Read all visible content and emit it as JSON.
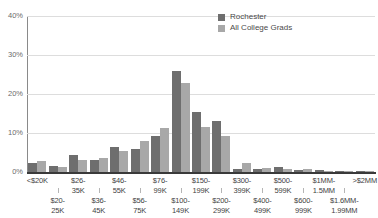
{
  "chart_data": {
    "type": "bar",
    "title": "",
    "xlabel": "",
    "ylabel": "",
    "ylim": [
      0,
      40
    ],
    "yticks": [
      0,
      10,
      20,
      30,
      40
    ],
    "ytick_labels": [
      "0%",
      "10%",
      "20%",
      "30%",
      "40%"
    ],
    "grid": true,
    "legend_position": "top-right",
    "categories": [
      "<$20K",
      "$20-25K",
      "$26-35K",
      "$36-45K",
      "$46-55K",
      "$56-75K",
      "$76-99K",
      "$100-149K",
      "$150-199K",
      "$200-299K",
      "$300-399K",
      "$400-499K",
      "$500-599K",
      "$600-999K",
      "$1MM-1.5MM",
      "$1.6MM-1.99MM",
      ">$2MM"
    ],
    "series": [
      {
        "name": "Rochester",
        "color": "#6e6e6e",
        "values": [
          2.2,
          1.6,
          4.3,
          3.2,
          6.3,
          6.0,
          9.3,
          26.0,
          15.3,
          13.0,
          0.9,
          0.7,
          1.3,
          0.5,
          0.5,
          0.2,
          0.2
        ]
      },
      {
        "name": "All College Grads",
        "color": "#a8a8a8",
        "values": [
          2.8,
          1.3,
          3.0,
          3.6,
          5.4,
          8.0,
          11.3,
          22.8,
          11.5,
          9.3,
          2.2,
          1.1,
          0.9,
          0.7,
          0.3,
          0.2,
          0.2
        ]
      }
    ]
  },
  "legend": {
    "items": [
      {
        "label": "Rochester",
        "color": "#6e6e6e"
      },
      {
        "label": "All College Grads",
        "color": "#a8a8a8"
      }
    ]
  },
  "axis": {
    "y_labels": [
      "40%",
      "30%",
      "20%",
      "10%",
      "0%"
    ],
    "x_labels_row_upper": [
      "<$20K",
      "$26-",
      "35K",
      "$46-",
      "55K",
      "$76-",
      "99K",
      "$150-",
      "199K",
      "$300-",
      "399K",
      "$500-",
      "599K",
      "$1MM-",
      "1.5MM",
      ">$2MM"
    ],
    "x_labels_grouped": [
      {
        "row": 0,
        "lines": [
          "<$20K"
        ]
      },
      {
        "row": 1,
        "lines": [
          "$20-",
          "25K"
        ]
      },
      {
        "row": 0,
        "lines": [
          "$26-",
          "35K"
        ]
      },
      {
        "row": 1,
        "lines": [
          "$36-",
          "45K"
        ]
      },
      {
        "row": 0,
        "lines": [
          "$46-",
          "55K"
        ]
      },
      {
        "row": 1,
        "lines": [
          "$56-",
          "75K"
        ]
      },
      {
        "row": 0,
        "lines": [
          "$76-",
          "99K"
        ]
      },
      {
        "row": 1,
        "lines": [
          "$100-",
          "149K"
        ]
      },
      {
        "row": 0,
        "lines": [
          "$150-",
          "199K"
        ]
      },
      {
        "row": 1,
        "lines": [
          "$200-",
          "299K"
        ]
      },
      {
        "row": 0,
        "lines": [
          "$300-",
          "399K"
        ]
      },
      {
        "row": 1,
        "lines": [
          "$400-",
          "499K"
        ]
      },
      {
        "row": 0,
        "lines": [
          "$500-",
          "599K"
        ]
      },
      {
        "row": 1,
        "lines": [
          "$600-",
          "999K"
        ]
      },
      {
        "row": 0,
        "lines": [
          "$1MM-",
          "1.5MM"
        ]
      },
      {
        "row": 1,
        "lines": [
          "$1.6MM-",
          "1.99MM"
        ]
      },
      {
        "row": 0,
        "lines": [
          ">$2MM"
        ]
      }
    ]
  },
  "colors": {
    "series_rochester": "#6e6e6e",
    "series_all_grads": "#a8a8a8",
    "gridline": "#dddddd",
    "axis": "#3a3a3a",
    "tick_text": "#6b6b6b",
    "label_text": "#3f3f3f",
    "background": "#ffffff"
  }
}
